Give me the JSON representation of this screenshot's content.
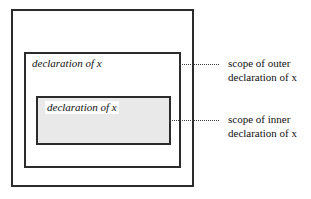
{
  "figure": {
    "kind": "scope-nesting-diagram",
    "background_color": "#ffffff",
    "line_color": "#2b2b2b",
    "shade_color": "#e9e9e9"
  },
  "boxes": {
    "outer_region": {
      "name": "outermost-enclosing-region",
      "label": ""
    },
    "outer_scope": {
      "name": "scope-of-outer-declaration",
      "declaration_label": "declaration of x"
    },
    "inner_scope": {
      "name": "scope-of-inner-declaration",
      "declaration_label": "declaration of x",
      "fill": "#e9e9e9"
    }
  },
  "annotations": [
    {
      "id": "outer",
      "line1": "scope of outer",
      "line2": "declaration of x"
    },
    {
      "id": "inner",
      "line1": "scope of inner",
      "line2": "declaration of x"
    }
  ]
}
